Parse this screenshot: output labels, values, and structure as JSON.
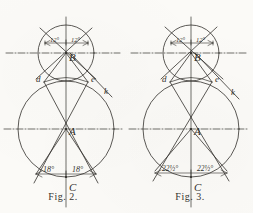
{
  "page": {
    "cut_header_text": "                   ",
    "ink_color": "#32302c",
    "paper_color": "#fbfaf7"
  },
  "figures": [
    {
      "id": "fig-2",
      "caption": "Fig. 2.",
      "points": [
        {
          "name": "A",
          "label": "A"
        },
        {
          "name": "B",
          "label": "B"
        },
        {
          "name": "C",
          "label": "C"
        },
        {
          "name": "d",
          "label": "d"
        },
        {
          "name": "e",
          "label": "e"
        },
        {
          "name": "k",
          "label": "k"
        }
      ],
      "upper_angles": [
        {
          "label": "12°",
          "side": "left"
        },
        {
          "label": "12°",
          "side": "right"
        }
      ],
      "lower_angles": [
        {
          "label": "18°",
          "side": "left"
        },
        {
          "label": "18°",
          "side": "right"
        }
      ]
    },
    {
      "id": "fig-3",
      "caption": "Fig. 3.",
      "points": [
        {
          "name": "A",
          "label": "A"
        },
        {
          "name": "B",
          "label": "B"
        },
        {
          "name": "C",
          "label": "C"
        },
        {
          "name": "d",
          "label": "d"
        },
        {
          "name": "e",
          "label": "e"
        },
        {
          "name": "k",
          "label": "k"
        }
      ],
      "upper_angles": [
        {
          "label": "12°",
          "side": "left"
        },
        {
          "label": "12°",
          "side": "right"
        }
      ],
      "lower_angles": [
        {
          "label": "22½°",
          "side": "left"
        },
        {
          "label": "22½°",
          "side": "right"
        }
      ]
    }
  ]
}
